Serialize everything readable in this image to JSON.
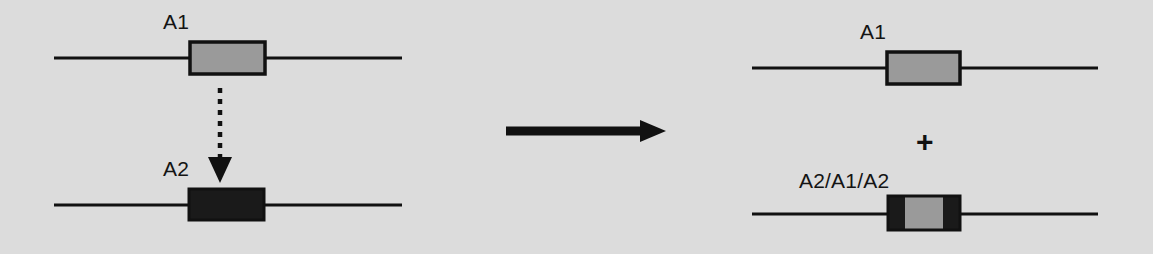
{
  "figure": {
    "background_color": "#dcdcdc",
    "line_color": "#111111",
    "gray_fill": "#9a9a9a",
    "dark_fill": "#1a1a1a",
    "stroke_color": "#111111"
  },
  "left_panel": {
    "top_allele": {
      "label": "A1",
      "fill": "#9a9a9a",
      "chromosome_line": {
        "x1": 54,
        "x2": 402,
        "y": 58
      },
      "box": {
        "x": 190,
        "y": 42,
        "width": 75,
        "height": 32
      }
    },
    "bottom_allele": {
      "label": "A2",
      "fill": "#1a1a1a",
      "chromosome_line": {
        "x1": 54,
        "x2": 402,
        "y": 205
      },
      "box": {
        "x": 189,
        "y": 189,
        "width": 75,
        "height": 31
      }
    },
    "transfer_arrow": {
      "name": "dashed-down-arrow",
      "style": "dashed",
      "x": 220,
      "y1": 88,
      "y2": 160
    }
  },
  "center": {
    "arrow": {
      "name": "process-arrow",
      "direction": "right",
      "x1": 506,
      "x2": 664,
      "y": 131
    }
  },
  "right_panel": {
    "top_allele": {
      "label": "A1",
      "fill": "#9a9a9a",
      "chromosome_line": {
        "x1": 752,
        "x2": 1098,
        "y": 68
      },
      "box": {
        "x": 887,
        "y": 52,
        "width": 73,
        "height": 32
      }
    },
    "operator": "+",
    "bottom_allele": {
      "label": "A2/A1/A2",
      "chromosome_line": {
        "x1": 752,
        "x2": 1098,
        "y": 214
      },
      "box": {
        "x": 888,
        "y": 196,
        "width": 72,
        "height": 34
      },
      "segments": [
        {
          "name": "A2",
          "fill": "#1a1a1a",
          "x": 888,
          "width": 17
        },
        {
          "name": "A1",
          "fill": "#9a9a9a",
          "x": 905,
          "width": 38
        },
        {
          "name": "A2",
          "fill": "#1a1a1a",
          "x": 943,
          "width": 17
        }
      ]
    }
  },
  "labels": {
    "left_top": "A1",
    "left_bottom": "A2",
    "right_top": "A1",
    "right_bottom": "A2/A1/A2",
    "plus": "+"
  }
}
